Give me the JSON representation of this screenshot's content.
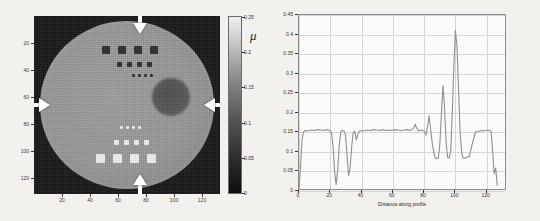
{
  "figure": {
    "panels": [
      "phantom-image",
      "profile-plot"
    ],
    "background_color": "#f2f1ee"
  },
  "left_panel": {
    "name": "reconstructed-phantom-image",
    "image_type": "grayscale-tomographic-slice",
    "x_ticks": [
      20,
      40,
      60,
      80,
      100,
      120
    ],
    "y_ticks": [
      20,
      40,
      60,
      80,
      100,
      120
    ],
    "x_range": [
      0,
      133
    ],
    "y_range": [
      0,
      133
    ],
    "features": {
      "background_label": "dark background",
      "phantom_label": "uniform circular phantom",
      "dark_inserts_label": "low-attenuation square inserts",
      "bright_inserts_label": "high-attenuation square inserts",
      "lesion_label": "low-attenuation circular lesion"
    },
    "profile_markers": {
      "count": 4,
      "top_arrow": "down-arrow",
      "bottom_arrow": "up-arrow",
      "left_arrow": "right-arrow",
      "right_arrow": "left-arrow"
    }
  },
  "colorbar": {
    "name": "mu-colorbar",
    "label": "μ",
    "min": 0,
    "max": 0.25,
    "ticks": [
      "0.25",
      "0.2",
      "0.15",
      "0.1",
      "0.05",
      "0"
    ],
    "tick_values": [
      0.25,
      0.2,
      0.15,
      0.1,
      0.05,
      0
    ],
    "colormap": "gray"
  },
  "chart_data": {
    "type": "line",
    "title": "",
    "xlabel": "Distance along profile",
    "ylabel": "μ",
    "xlim": [
      0,
      133
    ],
    "ylim": [
      0,
      0.45
    ],
    "grid": true,
    "legend": null,
    "xticks": [
      0,
      20,
      40,
      60,
      80,
      100,
      120
    ],
    "yticks": [
      0,
      0.05,
      0.1,
      0.15,
      0.2,
      0.25,
      0.3,
      0.35,
      0.4,
      0.45
    ],
    "ytick_labels": [
      "0",
      "0.05",
      "0.1",
      "0.15",
      "0.2",
      "0.25",
      "0.3",
      "0.35",
      "0.4",
      "0.45"
    ],
    "xtick_labels": [
      "0",
      "20",
      "40",
      "60",
      "80",
      "100",
      "120"
    ],
    "series": [
      {
        "name": "profile",
        "color": "#8f8f8f",
        "x": [
          0,
          1,
          2,
          3,
          4,
          6,
          8,
          10,
          12,
          14,
          16,
          18,
          20,
          21,
          22,
          23,
          24,
          25,
          26,
          27,
          28,
          29,
          30,
          31,
          32,
          33,
          34,
          35,
          36,
          37,
          38,
          39,
          40,
          42,
          44,
          46,
          48,
          50,
          52,
          54,
          56,
          58,
          60,
          62,
          64,
          66,
          68,
          70,
          72,
          74,
          75,
          76,
          77,
          78,
          79,
          80,
          81,
          82,
          83,
          84,
          85,
          86,
          87,
          88,
          89,
          90,
          91,
          92,
          93,
          94,
          95,
          96,
          97,
          98,
          99,
          100,
          101,
          102,
          103,
          104,
          105,
          106,
          107,
          108,
          110,
          112,
          114,
          116,
          118,
          120,
          121,
          122,
          123,
          124,
          125,
          126,
          127,
          128
        ],
        "y": [
          0.0,
          0.06,
          0.13,
          0.148,
          0.152,
          0.151,
          0.153,
          0.152,
          0.154,
          0.153,
          0.152,
          0.154,
          0.152,
          0.145,
          0.11,
          0.045,
          0.012,
          0.05,
          0.115,
          0.148,
          0.152,
          0.151,
          0.14,
          0.09,
          0.035,
          0.055,
          0.11,
          0.146,
          0.15,
          0.128,
          0.142,
          0.15,
          0.152,
          0.151,
          0.153,
          0.152,
          0.154,
          0.153,
          0.152,
          0.154,
          0.152,
          0.153,
          0.152,
          0.154,
          0.153,
          0.152,
          0.153,
          0.154,
          0.152,
          0.158,
          0.168,
          0.158,
          0.151,
          0.152,
          0.153,
          0.152,
          0.15,
          0.14,
          0.162,
          0.19,
          0.155,
          0.12,
          0.095,
          0.082,
          0.079,
          0.08,
          0.12,
          0.2,
          0.268,
          0.21,
          0.12,
          0.082,
          0.081,
          0.1,
          0.2,
          0.32,
          0.41,
          0.37,
          0.26,
          0.15,
          0.095,
          0.081,
          0.08,
          0.082,
          0.085,
          0.12,
          0.148,
          0.15,
          0.152,
          0.151,
          0.152,
          0.153,
          0.152,
          0.15,
          0.1,
          0.04,
          0.055,
          0.01
        ]
      }
    ]
  }
}
